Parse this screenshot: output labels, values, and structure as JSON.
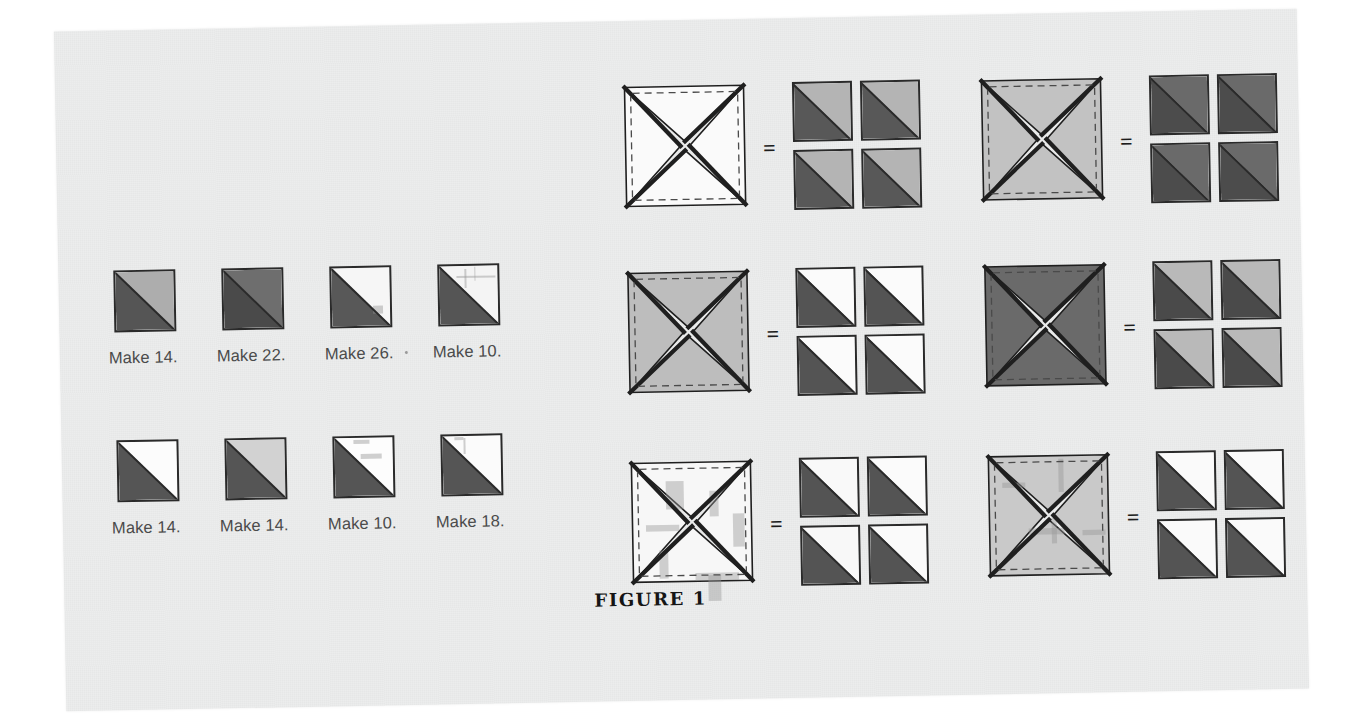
{
  "figure": {
    "caption": "FIGURE 1",
    "equals_symbol": "="
  },
  "colors": {
    "paper": "#eceded",
    "ink": "#2a2a2a",
    "dark": "#555555",
    "darker": "#4a4a4a",
    "very_dark": "#454545",
    "medium": "#9a9a9a",
    "light": "#c9c9c9",
    "lighter": "#d8d8d8",
    "white": "#fbfbfb",
    "label_text": "#4a4a4a"
  },
  "legend": {
    "rows": [
      {
        "cells": [
          {
            "label": "Make 14.",
            "lower_left": "#555555",
            "upper_right": "#adadad",
            "marks": []
          },
          {
            "label": "Make 22.",
            "lower_left": "#4a4a4a",
            "upper_right": "#6e6e6e",
            "marks": []
          },
          {
            "label": "Make 26.",
            "lower_left": "#585858",
            "upper_right": "#f6f6f6",
            "marks": [
              {
                "x": 66,
                "y": 62,
                "w": 16,
                "h": 13
              }
            ],
            "trailing_dot": true
          },
          {
            "label": "Make 10.",
            "lower_left": "#555555",
            "upper_right": "#f4f4f4",
            "marks": [
              {
                "x": 40,
                "y": 5,
                "w": 3,
                "h": 30
              },
              {
                "x": 28,
                "y": 16,
                "w": 62,
                "h": 3
              },
              {
                "x": 56,
                "y": 2,
                "w": 2,
                "h": 22
              }
            ]
          }
        ]
      },
      {
        "cells": [
          {
            "label": "Make 14.",
            "lower_left": "#555555",
            "upper_right": "#fcfcfc",
            "marks": []
          },
          {
            "label": "Make 14.",
            "lower_left": "#555555",
            "upper_right": "#d2d2d2",
            "marks": []
          },
          {
            "label": "Make 10.",
            "lower_left": "#555555",
            "upper_right": "#fdfdfd",
            "marks": [
              {
                "x": 42,
                "y": 26,
                "w": 34,
                "h": 8
              },
              {
                "x": 30,
                "y": 4,
                "w": 26,
                "h": 5
              }
            ]
          },
          {
            "label": "Make 18.",
            "lower_left": "#555555",
            "upper_right": "#fbfbfb",
            "marks": [
              {
                "x": 34,
                "y": 3,
                "w": 3,
                "h": 26
              },
              {
                "x": 20,
                "y": 2,
                "w": 14,
                "h": 4
              }
            ]
          }
        ]
      }
    ]
  },
  "units": [
    {
      "name": "unit-top-left",
      "pinwheel_fill": "#fafafa",
      "pinwheel_marks": [],
      "results": [
        {
          "lower_left": "#585858",
          "upper_right": "#b4b4b4"
        },
        {
          "lower_left": "#585858",
          "upper_right": "#b4b4b4"
        },
        {
          "lower_left": "#585858",
          "upper_right": "#b4b4b4"
        },
        {
          "lower_left": "#585858",
          "upper_right": "#b4b4b4"
        }
      ]
    },
    {
      "name": "unit-top-right",
      "pinwheel_fill": "#c2c2c2",
      "pinwheel_marks": [],
      "results": [
        {
          "lower_left": "#4c4c4c",
          "upper_right": "#6a6a6a"
        },
        {
          "lower_left": "#4c4c4c",
          "upper_right": "#6a6a6a"
        },
        {
          "lower_left": "#4c4c4c",
          "upper_right": "#6a6a6a"
        },
        {
          "lower_left": "#4c4c4c",
          "upper_right": "#6a6a6a"
        }
      ]
    },
    {
      "name": "unit-middle-left",
      "pinwheel_fill": "#bdbdbd",
      "pinwheel_marks": [],
      "results": [
        {
          "lower_left": "#545454",
          "upper_right": "#fbfbfb"
        },
        {
          "lower_left": "#545454",
          "upper_right": "#fbfbfb"
        },
        {
          "lower_left": "#545454",
          "upper_right": "#fbfbfb"
        },
        {
          "lower_left": "#545454",
          "upper_right": "#fbfbfb"
        }
      ]
    },
    {
      "name": "unit-middle-right",
      "pinwheel_fill": "#6a6a6a",
      "pinwheel_marks": [],
      "results": [
        {
          "lower_left": "#4a4a4a",
          "upper_right": "#b9b9b9"
        },
        {
          "lower_left": "#4a4a4a",
          "upper_right": "#b9b9b9"
        },
        {
          "lower_left": "#4a4a4a",
          "upper_right": "#b9b9b9"
        },
        {
          "lower_left": "#4a4a4a",
          "upper_right": "#b9b9b9"
        }
      ]
    },
    {
      "name": "unit-bottom-left",
      "pinwheel_fill": "#f7f7f7",
      "pinwheel_marks": [
        {
          "x": 30,
          "y": 18,
          "w": 14,
          "h": 22
        },
        {
          "x": 64,
          "y": 26,
          "w": 7,
          "h": 20
        },
        {
          "x": 14,
          "y": 52,
          "w": 26,
          "h": 5
        },
        {
          "x": 82,
          "y": 44,
          "w": 9,
          "h": 26
        },
        {
          "x": 24,
          "y": 72,
          "w": 7,
          "h": 22
        },
        {
          "x": 52,
          "y": 90,
          "w": 34,
          "h": 6
        },
        {
          "x": 62,
          "y": 92,
          "w": 10,
          "h": 20
        }
      ],
      "results": [
        {
          "lower_left": "#545454",
          "upper_right": "#f9f9f9"
        },
        {
          "lower_left": "#545454",
          "upper_right": "#fbfbfb"
        },
        {
          "lower_left": "#545454",
          "upper_right": "#f8f8f8"
        },
        {
          "lower_left": "#545454",
          "upper_right": "#fafafa"
        }
      ]
    },
    {
      "name": "unit-bottom-right",
      "pinwheel_fill": "#c9c9c9",
      "pinwheel_marks": [
        {
          "x": 58,
          "y": 6,
          "w": 4,
          "h": 26
        },
        {
          "x": 14,
          "y": 24,
          "w": 18,
          "h": 4
        },
        {
          "x": 34,
          "y": 60,
          "w": 28,
          "h": 5
        },
        {
          "x": 52,
          "y": 52,
          "w": 4,
          "h": 20
        },
        {
          "x": 76,
          "y": 62,
          "w": 18,
          "h": 4
        }
      ],
      "results": [
        {
          "lower_left": "#545454",
          "upper_right": "#fafafa"
        },
        {
          "lower_left": "#545454",
          "upper_right": "#fafafa"
        },
        {
          "lower_left": "#545454",
          "upper_right": "#fafafa"
        },
        {
          "lower_left": "#545454",
          "upper_right": "#fafafa"
        }
      ]
    }
  ]
}
